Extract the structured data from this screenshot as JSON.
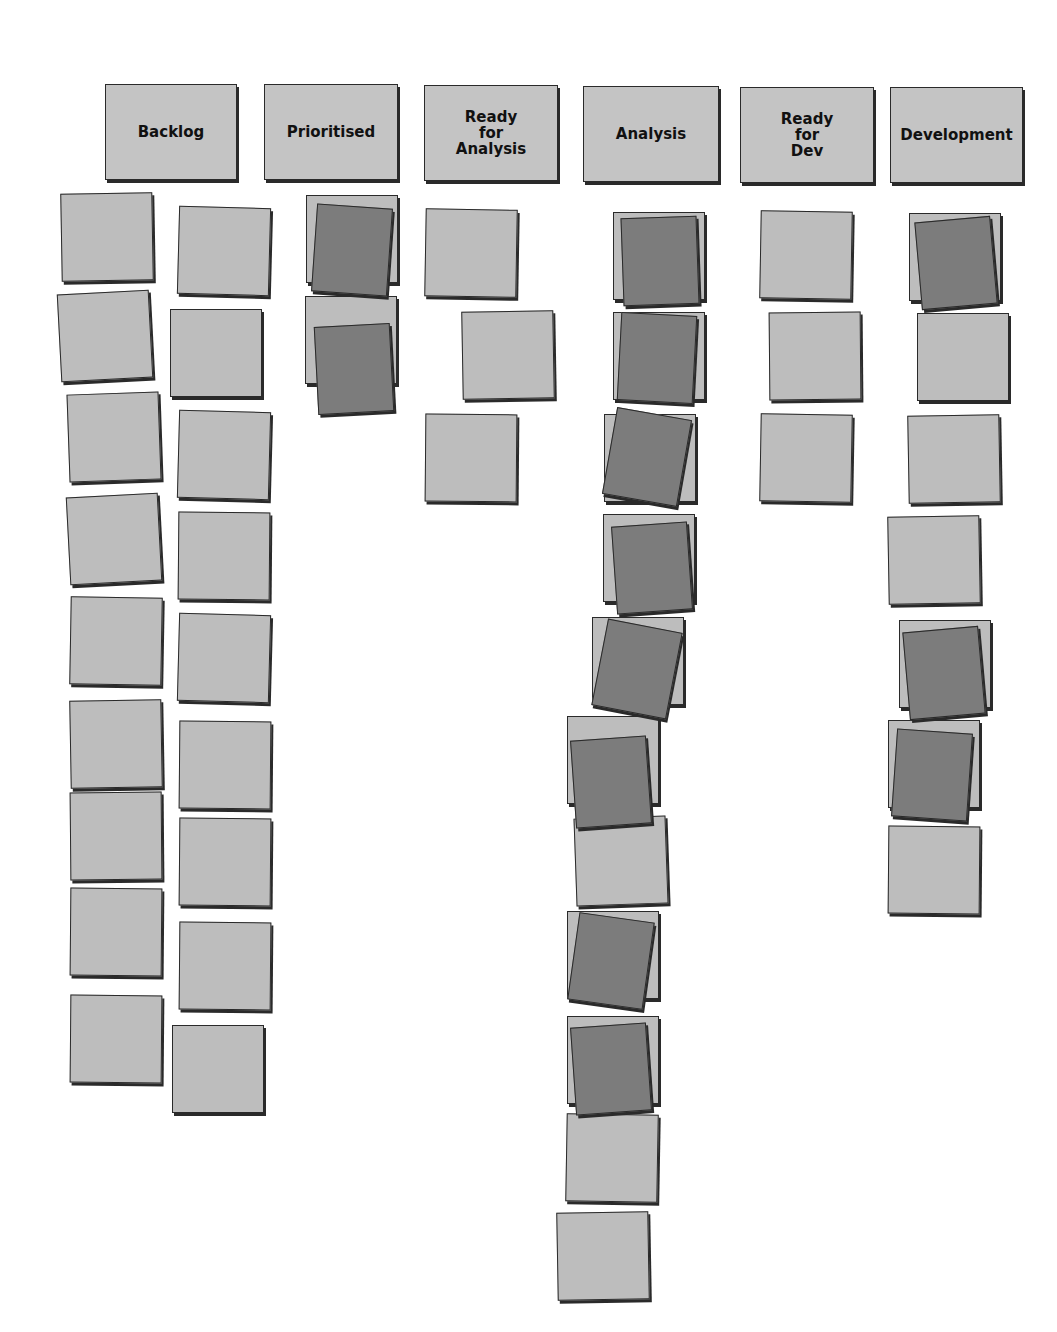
{
  "board": {
    "colors": {
      "background": "#ffffff",
      "light_card": "#bdbdbd",
      "dark_card": "#7c7c7c",
      "header": "#c4c4c4",
      "border": "#2a2a2a"
    },
    "columns": [
      {
        "label": "Backlog",
        "x": 105,
        "y": 84,
        "w": 132,
        "h": 96
      },
      {
        "label": "Prioritised",
        "x": 264,
        "y": 84,
        "w": 134,
        "h": 96
      },
      {
        "label": "Ready\nfor\nAnalysis",
        "x": 424,
        "y": 85,
        "w": 134,
        "h": 96
      },
      {
        "label": "Analysis",
        "x": 583,
        "y": 86,
        "w": 136,
        "h": 96
      },
      {
        "label": "Ready\nfor\nDev",
        "x": 740,
        "y": 87,
        "w": 134,
        "h": 96
      },
      {
        "label": "Development",
        "x": 890,
        "y": 87,
        "w": 133,
        "h": 96
      }
    ],
    "cards": [
      {
        "column": "Backlog",
        "type": "light",
        "x": 61,
        "y": 193,
        "r": -1
      },
      {
        "column": "Backlog",
        "type": "light",
        "x": 178,
        "y": 207,
        "r": 1.5
      },
      {
        "column": "Backlog",
        "type": "light",
        "x": 59,
        "y": 292,
        "r": -3
      },
      {
        "column": "Backlog",
        "type": "light",
        "x": 170,
        "y": 309,
        "r": 0
      },
      {
        "column": "Backlog",
        "type": "light",
        "x": 68,
        "y": 393,
        "r": -2
      },
      {
        "column": "Backlog",
        "type": "light",
        "x": 178,
        "y": 411,
        "r": 1.5
      },
      {
        "column": "Backlog",
        "type": "light",
        "x": 68,
        "y": 495,
        "r": -3
      },
      {
        "column": "Backlog",
        "type": "light",
        "x": 178,
        "y": 512,
        "r": 0.5
      },
      {
        "column": "Backlog",
        "type": "light",
        "x": 70,
        "y": 597,
        "r": 1
      },
      {
        "column": "Backlog",
        "type": "light",
        "x": 178,
        "y": 614,
        "r": 1.5
      },
      {
        "column": "Backlog",
        "type": "light",
        "x": 70,
        "y": 700,
        "r": -1
      },
      {
        "column": "Backlog",
        "type": "light",
        "x": 179,
        "y": 721,
        "r": 0.5
      },
      {
        "column": "Backlog",
        "type": "light",
        "x": 70,
        "y": 792,
        "r": -0.5
      },
      {
        "column": "Backlog",
        "type": "light",
        "x": 179,
        "y": 818,
        "r": 0.5
      },
      {
        "column": "Backlog",
        "type": "light",
        "x": 70,
        "y": 888,
        "r": 0.5
      },
      {
        "column": "Backlog",
        "type": "light",
        "x": 179,
        "y": 922,
        "r": 0.5
      },
      {
        "column": "Backlog",
        "type": "light",
        "x": 70,
        "y": 995,
        "r": 0.5
      },
      {
        "column": "Backlog",
        "type": "light",
        "x": 172,
        "y": 1025,
        "r": 0
      },
      {
        "column": "Prioritised",
        "type": "light",
        "x": 306,
        "y": 195,
        "r": 0
      },
      {
        "column": "Prioritised",
        "type": "dark",
        "x": 314,
        "y": 206,
        "r": 4
      },
      {
        "column": "Prioritised",
        "type": "light",
        "x": 305,
        "y": 296,
        "r": 0
      },
      {
        "column": "Prioritised",
        "type": "dark",
        "x": 316,
        "y": 325,
        "r": -3
      },
      {
        "column": "Ready for Analysis",
        "type": "light",
        "x": 425,
        "y": 209,
        "r": 1
      },
      {
        "column": "Ready for Analysis",
        "type": "light",
        "x": 462,
        "y": 311,
        "r": -1
      },
      {
        "column": "Ready for Analysis",
        "type": "light",
        "x": 425,
        "y": 414,
        "r": 0.5
      },
      {
        "column": "Analysis",
        "type": "light",
        "x": 613,
        "y": 212,
        "r": 0
      },
      {
        "column": "Analysis",
        "type": "dark",
        "x": 622,
        "y": 217,
        "r": -2
      },
      {
        "column": "Analysis",
        "type": "light",
        "x": 613,
        "y": 312,
        "r": 0
      },
      {
        "column": "Analysis",
        "type": "dark",
        "x": 619,
        "y": 314,
        "r": 3
      },
      {
        "column": "Analysis",
        "type": "light",
        "x": 604,
        "y": 414,
        "r": 0
      },
      {
        "column": "Analysis",
        "type": "dark",
        "x": 609,
        "y": 413,
        "r": 10
      },
      {
        "column": "Analysis",
        "type": "light",
        "x": 603,
        "y": 514,
        "r": 0
      },
      {
        "column": "Analysis",
        "type": "dark",
        "x": 614,
        "y": 524,
        "r": -4
      },
      {
        "column": "Analysis",
        "type": "light",
        "x": 592,
        "y": 617,
        "r": 0
      },
      {
        "column": "Analysis",
        "type": "dark",
        "x": 599,
        "y": 625,
        "r": 11
      },
      {
        "column": "Analysis",
        "type": "light",
        "x": 567,
        "y": 716,
        "r": 0
      },
      {
        "column": "Analysis",
        "type": "dark",
        "x": 573,
        "y": 738,
        "r": -4
      },
      {
        "column": "Analysis",
        "type": "light",
        "x": 575,
        "y": 817,
        "r": -2
      },
      {
        "column": "Analysis",
        "type": "light",
        "x": 567,
        "y": 911,
        "r": 0
      },
      {
        "column": "Analysis",
        "type": "dark",
        "x": 573,
        "y": 917,
        "r": 8
      },
      {
        "column": "Analysis",
        "type": "light",
        "x": 567,
        "y": 1016,
        "r": 0
      },
      {
        "column": "Analysis",
        "type": "dark",
        "x": 573,
        "y": 1025,
        "r": -4
      },
      {
        "column": "Analysis",
        "type": "light",
        "x": 566,
        "y": 1114,
        "r": 1
      },
      {
        "column": "Analysis",
        "type": "light",
        "x": 557,
        "y": 1212,
        "r": -1
      },
      {
        "column": "Ready for Dev",
        "type": "light",
        "x": 760,
        "y": 211,
        "r": 1
      },
      {
        "column": "Ready for Dev",
        "type": "light",
        "x": 769,
        "y": 312,
        "r": -0.5
      },
      {
        "column": "Ready for Dev",
        "type": "light",
        "x": 760,
        "y": 414,
        "r": 1
      },
      {
        "column": "Development",
        "type": "light",
        "x": 909,
        "y": 213,
        "r": 0
      },
      {
        "column": "Development",
        "type": "dark",
        "x": 918,
        "y": 219,
        "r": -5
      },
      {
        "column": "Development",
        "type": "light",
        "x": 917,
        "y": 313,
        "r": 0
      },
      {
        "column": "Development",
        "type": "light",
        "x": 908,
        "y": 415,
        "r": -1
      },
      {
        "column": "Development",
        "type": "light",
        "x": 888,
        "y": 516,
        "r": -1
      },
      {
        "column": "Development",
        "type": "light",
        "x": 899,
        "y": 620,
        "r": 0
      },
      {
        "column": "Development",
        "type": "dark",
        "x": 906,
        "y": 629,
        "r": -5
      },
      {
        "column": "Development",
        "type": "light",
        "x": 888,
        "y": 720,
        "r": 0
      },
      {
        "column": "Development",
        "type": "dark",
        "x": 894,
        "y": 731,
        "r": 4
      },
      {
        "column": "Development",
        "type": "light",
        "x": 888,
        "y": 826,
        "r": 0.5
      }
    ]
  }
}
